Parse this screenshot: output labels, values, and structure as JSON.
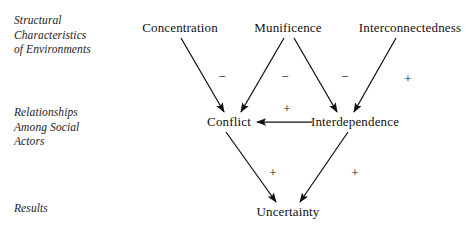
{
  "figure": {
    "type": "conceptual-path-diagram",
    "background_color": "#ffffff",
    "ink_color": "#111111",
    "width": 472,
    "height": 231
  },
  "row_labels": [
    {
      "id": "structural-characteristics",
      "text": "Structural\nCharacteristics\nof Environments",
      "x": 14,
      "y": 13
    },
    {
      "id": "relationships-among-social-actors",
      "text": "Relationships\nAmong Social\nActors",
      "x": 14,
      "y": 105
    },
    {
      "id": "results",
      "text": "Results",
      "x": 14,
      "y": 201
    }
  ],
  "nodes": [
    {
      "id": "concentration",
      "label": "Concentration",
      "x": 180,
      "y": 28,
      "tier": "structural"
    },
    {
      "id": "munificence",
      "label": "Munificence",
      "x": 288,
      "y": 28,
      "tier": "structural"
    },
    {
      "id": "interconnectedness",
      "label": "Interconnectedness",
      "x": 410,
      "y": 28,
      "tier": "structural"
    },
    {
      "id": "conflict",
      "label": "Conflict",
      "x": 229,
      "y": 122,
      "tier": "relationships"
    },
    {
      "id": "interdependence",
      "label": "Interdependence",
      "x": 355,
      "y": 122,
      "tier": "relationships"
    },
    {
      "id": "uncertainty",
      "label": "Uncertainty",
      "x": 288,
      "y": 212,
      "tier": "results"
    }
  ],
  "edges": [
    {
      "id": "concentration-to-conflict",
      "from": "concentration",
      "to": "conflict",
      "sign": "−",
      "sign_x": 222,
      "sign_y": 76,
      "x1": 181,
      "y1": 38,
      "x2": 224,
      "y2": 112
    },
    {
      "id": "munificence-to-conflict",
      "from": "munificence",
      "to": "conflict",
      "sign": "−",
      "sign_x": 285,
      "sign_y": 76,
      "x1": 284,
      "y1": 38,
      "x2": 241,
      "y2": 112
    },
    {
      "id": "munificence-to-interdependence",
      "from": "munificence",
      "to": "interdependence",
      "sign": "−",
      "sign_x": 345,
      "sign_y": 76,
      "x1": 294,
      "y1": 38,
      "x2": 337,
      "y2": 112
    },
    {
      "id": "interconnectedness-to-interdependence",
      "from": "interconnectedness",
      "to": "interdependence",
      "sign": "+",
      "sign_x": 408,
      "sign_y": 78,
      "x1": 396,
      "y1": 38,
      "x2": 354,
      "y2": 112
    },
    {
      "id": "interdependence-to-conflict",
      "from": "interdependence",
      "to": "conflict",
      "sign": "+",
      "sign_x": 287,
      "sign_y": 108,
      "x1": 312,
      "y1": 122,
      "x2": 257,
      "y2": 122
    },
    {
      "id": "conflict-to-uncertainty",
      "from": "conflict",
      "to": "uncertainty",
      "sign": "+",
      "sign_x": 273,
      "sign_y": 172,
      "x1": 226,
      "y1": 132,
      "x2": 276,
      "y2": 202
    },
    {
      "id": "interdependence-to-uncertainty",
      "from": "interdependence",
      "to": "uncertainty",
      "sign": "+",
      "sign_x": 355,
      "sign_y": 172,
      "x1": 348,
      "y1": 132,
      "x2": 300,
      "y2": 202
    }
  ],
  "legend": {
    "minus_sign": "−",
    "plus_sign": "+"
  }
}
